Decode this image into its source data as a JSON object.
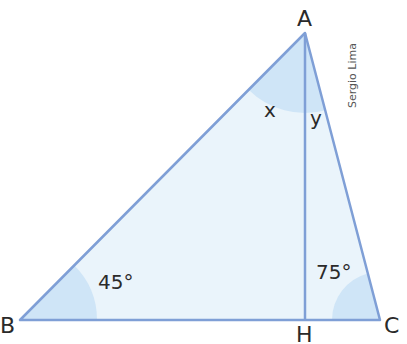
{
  "figure": {
    "vertices": {
      "A": "A",
      "B": "B",
      "C": "C",
      "H": "H"
    },
    "angles": {
      "B": "45°",
      "C": "75°",
      "x": "x",
      "y": "y"
    },
    "credit": "Sergio Lima",
    "colors": {
      "fill": "#eaf4fb",
      "stroke": "#7f9fd6",
      "arc": "#cfe5f7",
      "text": "#2a2a2a"
    }
  }
}
